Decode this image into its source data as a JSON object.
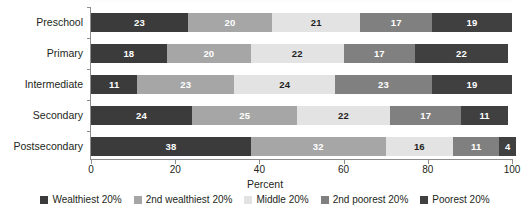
{
  "chart_data": {
    "type": "bar",
    "orientation": "horizontal",
    "stacked": true,
    "stack_mode": "percent",
    "title": "",
    "xlabel": "Percent",
    "ylabel": "",
    "xlim": [
      0,
      100
    ],
    "xticks": [
      0,
      20,
      40,
      60,
      80,
      100
    ],
    "xtick_labels": [
      "0",
      "20",
      "40",
      "60",
      "80",
      "100"
    ],
    "grid": false,
    "legend_position": "bottom",
    "categories": [
      "Preschool",
      "Primary",
      "Intermediate",
      "Secondary",
      "Postsecondary"
    ],
    "series": [
      {
        "name": "Wealthiest 20%",
        "color": "#3b3b3b",
        "label_on_dark": true,
        "values": [
          23,
          18,
          11,
          24,
          38
        ]
      },
      {
        "name": "2nd wealthiest 20%",
        "color": "#a6a6a6",
        "label_on_dark": true,
        "values": [
          20,
          20,
          23,
          25,
          32
        ]
      },
      {
        "name": "Middle 20%",
        "color": "#e3e3e3",
        "label_on_dark": false,
        "values": [
          21,
          22,
          24,
          22,
          16
        ]
      },
      {
        "name": "2nd poorest 20%",
        "color": "#808080",
        "label_on_dark": true,
        "values": [
          17,
          17,
          23,
          17,
          11
        ]
      },
      {
        "name": "Poorest 20%",
        "color": "#404040",
        "label_on_dark": true,
        "values": [
          19,
          22,
          19,
          11,
          4
        ]
      }
    ]
  },
  "axis": {
    "x_title": "Percent"
  }
}
